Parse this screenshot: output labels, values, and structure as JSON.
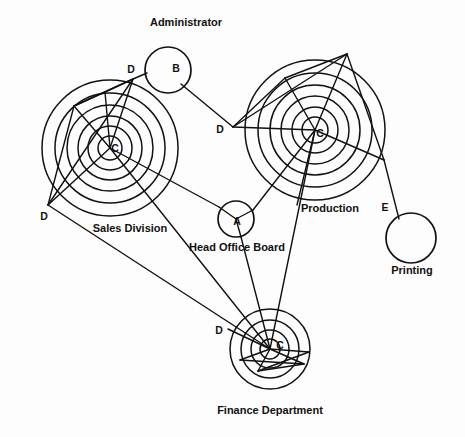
{
  "diagram": {
    "background_color": "#fdfdfd",
    "stroke_color": "#111111",
    "width": 465,
    "height": 437,
    "captions": [
      {
        "id": "cap-administrator",
        "text": "Administrator",
        "x": 186,
        "y": 25,
        "anchor": "middle"
      },
      {
        "id": "cap-sales",
        "text": "Sales Division",
        "x": 130,
        "y": 232,
        "anchor": "middle"
      },
      {
        "id": "cap-head-office",
        "text": "Head Office Board",
        "x": 237,
        "y": 250,
        "anchor": "middle"
      },
      {
        "id": "cap-production",
        "text": "Production",
        "x": 330,
        "y": 212,
        "anchor": "middle"
      },
      {
        "id": "cap-printing",
        "text": "Printing",
        "x": 412,
        "y": 273,
        "anchor": "middle"
      },
      {
        "id": "cap-finance",
        "text": "Finance Department",
        "x": 270,
        "y": 413,
        "anchor": "middle"
      }
    ],
    "node_labels": [
      {
        "id": "label-b",
        "text": "B",
        "x": 176,
        "y": 72
      },
      {
        "id": "label-a",
        "text": "A",
        "x": 237,
        "y": 225
      },
      {
        "id": "label-e",
        "text": "E",
        "x": 385,
        "y": 211
      },
      {
        "id": "label-c-sales",
        "text": "C",
        "x": 113,
        "y": 150
      },
      {
        "id": "label-c-prod",
        "text": "C",
        "x": 319,
        "y": 136
      },
      {
        "id": "label-c-finance",
        "text": "C",
        "x": 279,
        "y": 348
      },
      {
        "id": "label-d-sales-top",
        "text": "D",
        "x": 131,
        "y": 73
      },
      {
        "id": "label-d-sales-bot",
        "text": "D",
        "x": 44,
        "y": 219
      },
      {
        "id": "label-d-prod",
        "text": "D",
        "x": 220,
        "y": 132
      },
      {
        "id": "label-d-finance",
        "text": "D",
        "x": 219,
        "y": 334
      }
    ],
    "clusters": [
      {
        "id": "cluster-sales",
        "name": "Sales Division",
        "center_label": "C",
        "cx": 110,
        "cy": 148,
        "ring_radii": [
          12,
          22,
          32,
          43,
          55,
          68
        ]
      },
      {
        "id": "cluster-production",
        "name": "Production",
        "center_label": "C",
        "cx": 315,
        "cy": 130,
        "ring_radii": [
          13,
          23,
          34,
          45,
          57,
          70
        ]
      },
      {
        "id": "cluster-finance",
        "name": "Finance Department",
        "center_label": "C",
        "cx": 270,
        "cy": 349,
        "ring_radii": [
          10,
          19,
          29,
          40
        ]
      }
    ],
    "nodes": [
      {
        "id": "node-b",
        "label": "B",
        "caption": "Administrator",
        "cx": 168,
        "cy": 70,
        "r": 23
      },
      {
        "id": "node-a",
        "label": "A",
        "caption": "Head Office Board",
        "cx": 236,
        "cy": 219,
        "r": 18
      },
      {
        "id": "node-e",
        "label": "E",
        "caption": "Printing",
        "cx": 411,
        "cy": 238,
        "r": 25
      }
    ],
    "vertices": {
      "d_sales_top": {
        "x": 133,
        "y": 79
      },
      "d_sales_bot": {
        "x": 48,
        "y": 205
      },
      "d_sales_inner": {
        "x": 74,
        "y": 106
      },
      "d_prod": {
        "x": 233,
        "y": 127
      },
      "d_prod_top": {
        "x": 347,
        "y": 54
      },
      "d_prod_upper": {
        "x": 285,
        "y": 78
      },
      "d_prod_right": {
        "x": 384,
        "y": 160
      },
      "d_finance": {
        "x": 228,
        "y": 329
      },
      "d_fin_low": {
        "x": 258,
        "y": 371
      },
      "d_fin_left": {
        "x": 257,
        "y": 366
      },
      "c_sales": {
        "x": 110,
        "y": 148
      },
      "c_prod": {
        "x": 315,
        "y": 130
      },
      "c_finance": {
        "x": 270,
        "y": 349
      },
      "a": {
        "x": 236,
        "y": 219
      },
      "b": {
        "x": 168,
        "y": 70
      },
      "e": {
        "x": 411,
        "y": 238
      }
    },
    "links": [
      {
        "id": "link-dsalestop-b",
        "from": "d_sales_top",
        "to": "b",
        "desc": "Sales D to Administrator B"
      },
      {
        "id": "link-b-dprod",
        "from": "b",
        "to": "d_prod",
        "desc": "Administrator B to Production D"
      },
      {
        "id": "link-csales-a",
        "from": "c_sales",
        "to": "a",
        "desc": "Sales C to Head Office Board A"
      },
      {
        "id": "link-a-cprod",
        "from": "a",
        "to": "c_prod",
        "desc": "Head Office Board A to Production C"
      },
      {
        "id": "link-a-cfinance",
        "from": "a",
        "to": "c_finance",
        "desc": "Head Office Board A to Finance C"
      },
      {
        "id": "link-csales-cfin",
        "from": "c_sales",
        "to": "c_finance",
        "desc": "Sales C to Finance C"
      },
      {
        "id": "link-dsalesbot-cfin",
        "from": "d_sales_bot",
        "to": "d_finance",
        "desc": "Sales D to Finance D"
      },
      {
        "id": "link-cprod-cfin",
        "from": "c_prod",
        "to": "c_finance",
        "desc": "Production C to Finance C"
      },
      {
        "id": "link-dprodright-e",
        "from": "d_prod_right",
        "to": "e",
        "desc": "Production edge to Printing E"
      }
    ]
  }
}
